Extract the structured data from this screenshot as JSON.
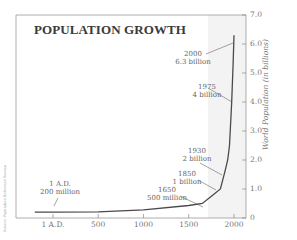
{
  "chart_data": {
    "type": "line",
    "title": "POPULATION GROWTH",
    "xlabel": "",
    "ylabel": "World Population (in billions)",
    "x_ticks": [
      "1 A.D.",
      "500",
      "1000",
      "1500",
      "2000"
    ],
    "y_ticks": [
      "0",
      "1.0",
      "2.0",
      "3.0",
      "4.0",
      "5.0",
      "6.0",
      "7.0"
    ],
    "ylim": [
      0,
      7
    ],
    "xlim": [
      -200,
      2000
    ],
    "y_axis_position": "right",
    "grid": false,
    "legend": null,
    "series": [
      {
        "name": "World Population",
        "x": [
          -200,
          1,
          500,
          1000,
          1500,
          1650,
          1750,
          1850,
          1900,
          1930,
          1950,
          1975,
          1990,
          2000
        ],
        "values": [
          0.2,
          0.2,
          0.21,
          0.28,
          0.43,
          0.5,
          0.75,
          1.0,
          1.6,
          2.0,
          2.5,
          4.0,
          5.3,
          6.3
        ]
      }
    ],
    "annotations": [
      {
        "x": 1,
        "y": 0.2,
        "line1": "1 A.D.",
        "line2": "200 million"
      },
      {
        "x": 1650,
        "y": 0.5,
        "line1": "1650",
        "line2": "500 million"
      },
      {
        "x": 1850,
        "y": 1.0,
        "line1": "1850",
        "line2": "1 billion"
      },
      {
        "x": 1930,
        "y": 2.0,
        "line1": "1930",
        "line2": "2 billion"
      },
      {
        "x": 1975,
        "y": 4.0,
        "line1": "1975",
        "line2": "4 billion"
      },
      {
        "x": 2000,
        "y": 6.3,
        "line1": "2000",
        "line2": "6.3 billion"
      }
    ],
    "source_note": "Source: Population Reference Bureau"
  },
  "colors": {
    "line": "#4a4a4a",
    "axis": "#888888",
    "frame": "#9a9a9a",
    "shade": "#f2f2f2",
    "text": "#666666"
  }
}
